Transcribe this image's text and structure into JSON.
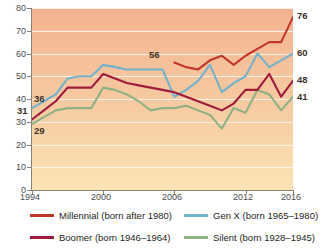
{
  "chart_data": {
    "type": "line",
    "title": "",
    "xlabel": "",
    "ylabel": "",
    "xlim": [
      1994,
      2016
    ],
    "ylim": [
      0,
      80
    ],
    "grid": true,
    "legend_position": "bottom",
    "x": [
      1994,
      1995,
      1996,
      1997,
      1998,
      1999,
      2000,
      2001,
      2002,
      2003,
      2004,
      2005,
      2006,
      2007,
      2008,
      2009,
      2010,
      2011,
      2012,
      2013,
      2014,
      2015,
      2016
    ],
    "y_ticks": [
      0,
      10,
      20,
      30,
      40,
      50,
      60,
      70,
      80
    ],
    "x_ticks": [
      1994,
      2000,
      2006,
      2012,
      2016
    ],
    "x_tick_labels": [
      "1994",
      "2000",
      "2006",
      "2012",
      "2016"
    ],
    "series": [
      {
        "name": "Millennial (born after 1980)",
        "label": "Millennial",
        "born": "born after 1980",
        "color": "#c0372a",
        "start_year": 2006,
        "start_value": 56,
        "end_value": 76,
        "x": [
          2006,
          2007,
          2008,
          2009,
          2010,
          2011,
          2012,
          2013,
          2014,
          2015,
          2016
        ],
        "values": [
          56,
          54,
          53,
          57,
          59,
          55,
          59,
          62,
          65,
          65,
          76
        ]
      },
      {
        "name": "Gen X (born 1965–1980)",
        "label": "Gen X",
        "born": "born 1965–1980",
        "color": "#74b2cc",
        "start_year": 1994,
        "start_value": 36,
        "end_value": 60,
        "x": [
          1994,
          1995,
          1996,
          1997,
          1998,
          1999,
          2000,
          2001,
          2002,
          2003,
          2004,
          2005,
          2006,
          2007,
          2008,
          2009,
          2010,
          2011,
          2012,
          2013,
          2014,
          2015,
          2016
        ],
        "values": [
          36,
          39,
          42,
          49,
          50,
          50,
          55,
          54,
          53,
          53,
          53,
          53,
          41,
          44,
          48,
          55,
          43,
          47,
          50,
          60,
          54,
          57,
          60
        ]
      },
      {
        "name": "Boomer (born 1946–1964)",
        "label": "Boomer",
        "born": "born 1946–1964",
        "color": "#9e1b3c",
        "start_year": 1994,
        "start_value": 31,
        "end_value": 48,
        "x": [
          1994,
          1995,
          1996,
          1997,
          1998,
          1999,
          2000,
          2001,
          2002,
          2003,
          2004,
          2005,
          2006,
          2007,
          2008,
          2009,
          2010,
          2011,
          2012,
          2013,
          2014,
          2015,
          2016
        ],
        "values": [
          31,
          35,
          39,
          45,
          45,
          45,
          51,
          49,
          47,
          46,
          45,
          44,
          43,
          41,
          39,
          37,
          35,
          38,
          44,
          44,
          51,
          41,
          48
        ]
      },
      {
        "name": "Silent (born 1928–1945)",
        "label": "Silent",
        "born": "born 1928–1945",
        "color": "#8fb183",
        "start_year": 1994,
        "start_value": 29,
        "end_value": 41,
        "x": [
          1994,
          1995,
          1996,
          1997,
          1998,
          1999,
          2000,
          2001,
          2002,
          2003,
          2004,
          2005,
          2006,
          2007,
          2008,
          2009,
          2010,
          2011,
          2012,
          2013,
          2014,
          2015,
          2016
        ],
        "values": [
          29,
          32,
          35,
          36,
          36,
          36,
          45,
          44,
          42,
          39,
          35,
          36,
          36,
          37,
          35,
          33,
          27,
          36,
          34,
          44,
          42,
          35,
          41
        ]
      }
    ],
    "annotations": [
      {
        "text": "36",
        "value": 36,
        "year": 1994,
        "position": "left",
        "series": "Gen X"
      },
      {
        "text": "31",
        "value": 31,
        "year": 1994,
        "position": "left",
        "series": "Boomer"
      },
      {
        "text": "29",
        "value": 29,
        "year": 1994,
        "position": "left",
        "series": "Silent"
      },
      {
        "text": "56",
        "value": 56,
        "year": 2006,
        "position": "above",
        "series": "Millennial"
      },
      {
        "text": "76",
        "value": 76,
        "year": 2016,
        "position": "right",
        "series": "Millennial"
      },
      {
        "text": "60",
        "value": 60,
        "year": 2016,
        "position": "right",
        "series": "Gen X"
      },
      {
        "text": "48",
        "value": 48,
        "year": 2016,
        "position": "right",
        "series": "Boomer"
      },
      {
        "text": "41",
        "value": 41,
        "year": 2016,
        "position": "right",
        "series": "Silent"
      }
    ],
    "colors": {
      "millennial": "#c0372a",
      "genx": "#74b2cc",
      "boomer": "#9e1b3c",
      "silent": "#8fb183",
      "gridline": "#fdf5ea",
      "background_top": "#f2b292",
      "background_bottom": "#fbe3b6",
      "axis": "#8a8074"
    }
  }
}
